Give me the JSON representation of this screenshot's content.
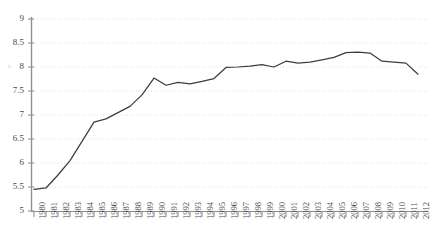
{
  "chart_data": {
    "type": "line",
    "title": "",
    "subtitle": "",
    "xlabel": "",
    "ylabel": "",
    "grid": true,
    "legend": null,
    "legend_position": "none",
    "xlim": [
      1980,
      2012
    ],
    "ylim": [
      5,
      9
    ],
    "ytick_labels": [
      "9",
      "8.5",
      "8",
      "7.5",
      "7",
      "6.5",
      "6",
      "5.5",
      "5"
    ],
    "ytick_values": [
      9,
      8.5,
      8,
      7.5,
      7,
      6.5,
      6,
      5.5,
      5
    ],
    "categories": [
      "1980",
      "1981",
      "1982",
      "1983",
      "1984",
      "1985",
      "1986",
      "1987",
      "1988",
      "1989",
      "1990",
      "1991",
      "1992",
      "1993",
      "1994",
      "1995",
      "1996",
      "1997",
      "1998",
      "1999",
      "2000",
      "2001",
      "2002",
      "2003",
      "2004",
      "2005",
      "2006",
      "2007",
      "2008",
      "2009",
      "2010",
      "2011",
      "2012"
    ],
    "x": [
      1980,
      1981,
      1982,
      1983,
      1984,
      1985,
      1986,
      1987,
      1988,
      1989,
      1990,
      1991,
      1992,
      1993,
      1994,
      1995,
      1996,
      1997,
      1998,
      1999,
      2000,
      2001,
      2002,
      2003,
      2004,
      2005,
      2006,
      2007,
      2008,
      2009,
      2010,
      2011,
      2012
    ],
    "values": [
      5.45,
      5.48,
      5.75,
      6.05,
      6.45,
      6.85,
      6.92,
      7.05,
      7.18,
      7.42,
      7.77,
      7.62,
      7.68,
      7.65,
      7.7,
      7.76,
      7.99,
      8.0,
      8.02,
      8.05,
      8.0,
      8.12,
      8.08,
      8.1,
      8.15,
      8.2,
      8.3,
      8.31,
      8.29,
      8.12,
      8.1,
      8.08,
      7.85
    ],
    "series": [
      {
        "name": "series-1",
        "color": "#3d3d3d",
        "values": [
          5.45,
          5.48,
          5.75,
          6.05,
          6.45,
          6.85,
          6.92,
          7.05,
          7.18,
          7.42,
          7.77,
          7.62,
          7.68,
          7.65,
          7.7,
          7.76,
          7.99,
          8.0,
          8.02,
          8.05,
          8.0,
          8.12,
          8.08,
          8.1,
          8.15,
          8.2,
          8.3,
          8.31,
          8.29,
          8.12,
          8.1,
          8.08,
          7.85
        ]
      }
    ],
    "colors": {
      "line": "#3d3d3d",
      "grid": "#f0d8d8",
      "axis": "#909090",
      "tick_text": "#4a4a4a",
      "background": "#ffffff"
    }
  }
}
